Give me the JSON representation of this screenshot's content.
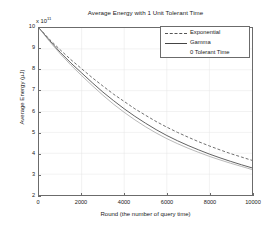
{
  "chart_data": {
    "type": "line",
    "title": "Average Energy with 1 Unit Tolerant Time",
    "xlabel": "Round (the number of query time)",
    "ylabel": "Average Energy (µJ)",
    "y_exponent_label": "x 10",
    "y_exponent_value": "11",
    "xlim": [
      0,
      10000
    ],
    "ylim": [
      2,
      10
    ],
    "grid": true,
    "legend_position": "upper-right",
    "xticks": [
      "0",
      "2000",
      "4000",
      "6000",
      "8000",
      "10000"
    ],
    "xtick_values": [
      0,
      2000,
      4000,
      6000,
      8000,
      10000
    ],
    "yticks": [
      "2",
      "3",
      "4",
      "5",
      "6",
      "7",
      "8",
      "9",
      "10"
    ],
    "ytick_values": [
      2,
      3,
      4,
      5,
      6,
      7,
      8,
      9,
      10
    ],
    "x": [
      0,
      500,
      1000,
      1500,
      2000,
      2500,
      3000,
      3500,
      4000,
      4500,
      5000,
      5500,
      6000,
      6500,
      7000,
      7500,
      8000,
      8500,
      9000,
      9500,
      10000
    ],
    "series": [
      {
        "name": "Exponential",
        "style": "dashed",
        "color": "#555555",
        "values": [
          10.0,
          9.45,
          8.95,
          8.48,
          8.05,
          7.62,
          7.22,
          6.83,
          6.48,
          6.13,
          5.82,
          5.52,
          5.25,
          5.0,
          4.77,
          4.55,
          4.35,
          4.16,
          3.98,
          3.82,
          3.66
        ]
      },
      {
        "name": "Gamma",
        "style": "solid",
        "color": "#444444",
        "values": [
          10.0,
          9.4,
          8.83,
          8.32,
          7.85,
          7.38,
          6.93,
          6.52,
          6.13,
          5.77,
          5.44,
          5.13,
          4.85,
          4.6,
          4.37,
          4.16,
          3.96,
          3.78,
          3.61,
          3.45,
          3.3
        ]
      },
      {
        "name": "0 Tolerant Time",
        "style": "solid-light",
        "color": "#9a9a9a",
        "values": [
          10.0,
          9.35,
          8.76,
          8.22,
          7.72,
          7.24,
          6.78,
          6.35,
          5.96,
          5.6,
          5.27,
          4.97,
          4.7,
          4.46,
          4.24,
          4.04,
          3.85,
          3.68,
          3.52,
          3.37,
          3.22
        ]
      }
    ]
  },
  "legend": {
    "items": [
      {
        "label": "Exponential"
      },
      {
        "label": "Gamma"
      },
      {
        "label": "0 Tolerant Time"
      }
    ]
  }
}
